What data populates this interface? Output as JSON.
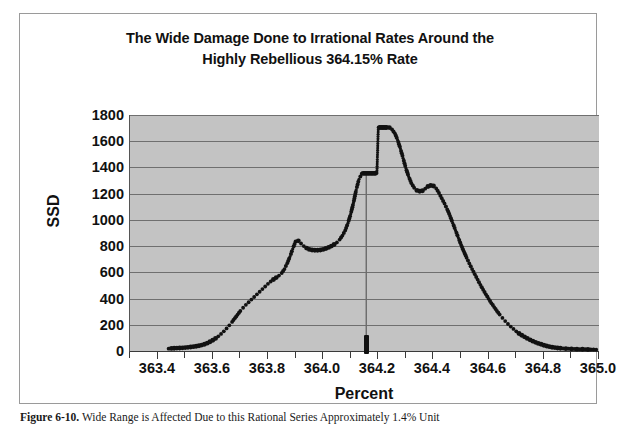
{
  "figure": {
    "caption_label": "Figure 6-10.",
    "caption_text": "Wide Range is Affected Due to this Rational Series Approximately 1.4% Unit"
  },
  "chart_data": {
    "type": "scatter",
    "title": "The Wide Damage Done to Irrational Rates Around the Highly Rebellious 364.15% Rate",
    "title_line1": "The Wide Damage Done to Irrational Rates Around the",
    "title_line2": "Highly Rebellious 364.15% Rate",
    "xlabel": "Percent",
    "ylabel": "SSD",
    "xlim": [
      363.3,
      365.0
    ],
    "ylim": [
      0,
      1800
    ],
    "grid": true,
    "legend": "none",
    "background": "#c3c3c3",
    "marker_color": "#111111",
    "x_ticks": [
      363.4,
      363.6,
      363.8,
      364.0,
      364.2,
      364.4,
      364.6,
      364.8,
      365.0
    ],
    "x_tick_labels": [
      "363.4",
      "363.6",
      "363.8",
      "364.0",
      "364.2",
      "364.4",
      "364.6",
      "364.8",
      "365.0"
    ],
    "x_minor_ticks": [
      363.3,
      363.5,
      363.7,
      363.9,
      364.1,
      364.3,
      364.5,
      364.7,
      364.9
    ],
    "y_ticks": [
      0,
      200,
      400,
      600,
      800,
      1000,
      1200,
      1400,
      1600,
      1800
    ],
    "y_tick_labels": [
      "0",
      "200",
      "400",
      "600",
      "800",
      "1000",
      "1200",
      "1400",
      "1600",
      "1800"
    ],
    "annotation": {
      "rate": "364.15%",
      "axis_marker_x": 364.16,
      "drop_line_from": 1355,
      "drop_line_to": 0,
      "plateau_low": 1355,
      "plateau_high": 1705
    },
    "x": [
      363.44,
      363.45,
      363.46,
      363.47,
      363.48,
      363.49,
      363.5,
      363.51,
      363.52,
      363.53,
      363.54,
      363.55,
      363.56,
      363.57,
      363.58,
      363.59,
      363.6,
      363.61,
      363.62,
      363.63,
      363.64,
      363.65,
      363.66,
      363.67,
      363.68,
      363.69,
      363.7,
      363.71,
      363.72,
      363.73,
      363.74,
      363.75,
      363.76,
      363.77,
      363.78,
      363.79,
      363.8,
      363.81,
      363.82,
      363.83,
      363.84,
      363.85,
      363.86,
      363.87,
      363.88,
      363.89,
      363.9,
      363.91,
      363.92,
      363.93,
      363.94,
      363.95,
      363.96,
      363.97,
      363.98,
      363.99,
      364.0,
      364.01,
      364.02,
      364.03,
      364.04,
      364.05,
      364.06,
      364.07,
      364.08,
      364.09,
      364.1,
      364.11,
      364.12,
      364.13,
      364.14,
      364.145,
      364.15,
      364.155,
      364.16,
      364.165,
      364.17,
      364.175,
      364.18,
      364.185,
      364.19,
      364.195,
      364.2,
      364.205,
      364.21,
      364.215,
      364.22,
      364.225,
      364.23,
      364.24,
      364.25,
      364.26,
      364.27,
      364.28,
      364.29,
      364.3,
      364.31,
      364.32,
      364.33,
      364.34,
      364.35,
      364.36,
      364.37,
      364.38,
      364.39,
      364.4,
      364.41,
      364.42,
      364.43,
      364.44,
      364.45,
      364.46,
      364.47,
      364.48,
      364.49,
      364.5,
      364.51,
      364.52,
      364.53,
      364.54,
      364.55,
      364.56,
      364.57,
      364.58,
      364.59,
      364.6,
      364.61,
      364.62,
      364.63,
      364.64,
      364.65,
      364.66,
      364.67,
      364.68,
      364.69,
      364.7,
      364.71,
      364.72,
      364.73,
      364.74,
      364.75,
      364.76,
      364.77,
      364.78,
      364.79,
      364.8,
      364.81,
      364.82,
      364.83,
      364.84,
      364.85,
      364.86,
      364.88,
      364.9,
      364.92,
      364.94,
      364.96,
      364.99
    ],
    "y": [
      18,
      20,
      21,
      22,
      23,
      24,
      26,
      28,
      30,
      33,
      36,
      40,
      45,
      52,
      60,
      70,
      82,
      96,
      112,
      130,
      150,
      172,
      196,
      222,
      250,
      278,
      305,
      330,
      352,
      372,
      392,
      412,
      432,
      452,
      472,
      492,
      512,
      530,
      545,
      560,
      575,
      595,
      625,
      670,
      720,
      780,
      835,
      840,
      820,
      800,
      785,
      775,
      770,
      768,
      768,
      770,
      775,
      782,
      790,
      800,
      812,
      828,
      850,
      880,
      920,
      975,
      1045,
      1130,
      1230,
      1310,
      1352,
      1355,
      1355,
      1355,
      1355,
      1355,
      1355,
      1355,
      1355,
      1355,
      1356,
      1357,
      1705,
      1705,
      1705,
      1705,
      1705,
      1705,
      1705,
      1704,
      1690,
      1660,
      1610,
      1545,
      1470,
      1395,
      1330,
      1280,
      1245,
      1225,
      1218,
      1222,
      1238,
      1255,
      1262,
      1258,
      1240,
      1205,
      1165,
      1125,
      1080,
      1030,
      975,
      920,
      865,
      810,
      760,
      712,
      668,
      625,
      585,
      545,
      505,
      468,
      432,
      398,
      365,
      335,
      305,
      278,
      252,
      228,
      206,
      186,
      168,
      150,
      134,
      120,
      108,
      96,
      85,
      75,
      66,
      58,
      51,
      44,
      38,
      33,
      29,
      26,
      23,
      21,
      18,
      16,
      14,
      13,
      12,
      10
    ]
  }
}
